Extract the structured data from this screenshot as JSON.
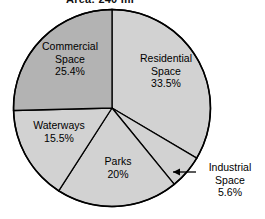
{
  "chart_data": {
    "type": "pie",
    "title": "Area: 240 mi",
    "categories": [
      "Residential Space",
      "Industrial Space",
      "Parks",
      "Waterways",
      "Commercial Space"
    ],
    "values": [
      33.5,
      5.6,
      20,
      15.5,
      25.4
    ],
    "value_labels": [
      "33.5%",
      "5.6%",
      "20%",
      "15.5%",
      "25.4%"
    ],
    "units": "percent",
    "start_angle_deg": 0,
    "direction": "clockwise",
    "legend": "none",
    "grid": false,
    "slices": [
      {
        "name": "Residential Space",
        "label_line1": "Residential",
        "label_line2": "Space",
        "value": 33.5,
        "value_label": "33.5%",
        "color": "#d2d2d2",
        "start_deg": 0,
        "end_deg": 120.6,
        "label_placement": "inside"
      },
      {
        "name": "Industrial Space",
        "label_line1": "Industrial",
        "label_line2": "Space",
        "value": 5.6,
        "value_label": "5.6%",
        "color": "#d2d2d2",
        "start_deg": 120.6,
        "end_deg": 140.76,
        "label_placement": "outside-callout"
      },
      {
        "name": "Parks",
        "label_line1": "Parks",
        "label_line2": "",
        "value": 20,
        "value_label": "20%",
        "color": "#d2d2d2",
        "start_deg": 140.76,
        "end_deg": 212.76,
        "label_placement": "inside"
      },
      {
        "name": "Waterways",
        "label_line1": "Waterways",
        "label_line2": "",
        "value": 15.5,
        "value_label": "15.5%",
        "color": "#d2d2d2",
        "start_deg": 212.76,
        "end_deg": 268.56,
        "label_placement": "inside"
      },
      {
        "name": "Commercial Space",
        "label_line1": "Commercial",
        "label_line2": "Space",
        "value": 25.4,
        "value_label": "25.4%",
        "color": "#b3b3b3",
        "start_deg": 268.56,
        "end_deg": 360,
        "label_placement": "inside"
      }
    ],
    "colors": {
      "slice_default": "#d2d2d2",
      "slice_highlight": "#b3b3b3",
      "outline": "#000000",
      "background": "#ffffff",
      "text": "#000000"
    }
  }
}
